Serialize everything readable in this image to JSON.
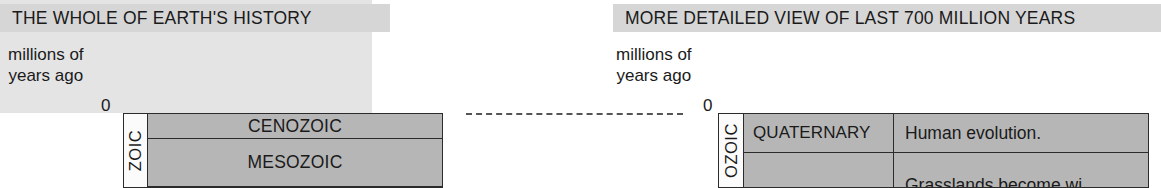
{
  "left_panel": {
    "banner_label": "THE WHOLE OF EARTH'S HISTORY",
    "axis_caption_line1": "millions of",
    "axis_caption_line2": "years ago",
    "zero_tick": "0",
    "eon_label": "ZOIC",
    "eras": [
      {
        "name": "CENOZOIC"
      },
      {
        "name": "MESOZOIC"
      }
    ]
  },
  "right_panel": {
    "banner_label": "MORE DETAILED VIEW OF LAST 700 MILLION YEARS",
    "axis_caption_line1": "millions of",
    "axis_caption_line2": "years ago",
    "zero_tick": "0",
    "eon_label": "OZOIC",
    "rows": [
      {
        "period": "QUATERNARY",
        "event": "Human evolution."
      },
      {
        "period": "",
        "event": "Grasslands become wi"
      }
    ]
  },
  "connector": {
    "style": "dashed",
    "color": "#555555"
  },
  "colors": {
    "banner_background": "#d6d6d6",
    "panel_tint": "#e4e4e4",
    "table_fill": "#b6b6b6",
    "spine_fill": "#fbfbfb",
    "rule": "#2b2b2b",
    "text": "#1a1a1a",
    "page_background": "#ffffff"
  }
}
